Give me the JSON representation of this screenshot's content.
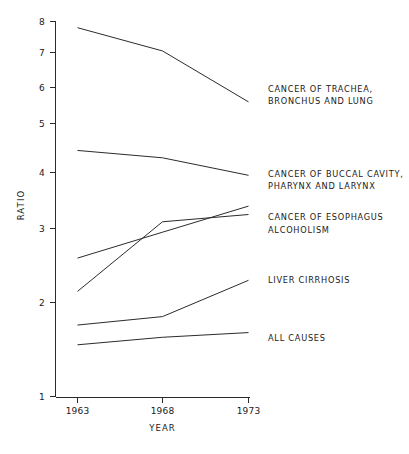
{
  "chart_data": {
    "type": "line",
    "title": "",
    "xlabel": "YEAR",
    "ylabel": "RATIO",
    "x": [
      1963,
      1968,
      1973
    ],
    "xtick_labels": [
      "1963",
      "1968",
      "1973"
    ],
    "ytick_labels": [
      "1",
      "2",
      "3",
      "4",
      "5",
      "6",
      "7",
      "8"
    ],
    "ytick_values": [
      1,
      2,
      3,
      4,
      5,
      6,
      7,
      8
    ],
    "ylim": [
      1,
      8
    ],
    "yscale": "log",
    "grid": false,
    "legend_position": "right-inline",
    "series": [
      {
        "name": "CANCER OF TRACHEA, BRONCHUS AND LUNG",
        "label_lines": [
          "CANCER OF TRACHEA,",
          "BRONCHUS AND LUNG"
        ],
        "values": [
          7.8,
          7.05,
          5.6
        ]
      },
      {
        "name": "CANCER OF BUCCAL CAVITY, PHARYNX AND LARYNX",
        "label_lines": [
          "CANCER OF BUCCAL CAVITY,",
          "PHARYNX AND LARYNX"
        ],
        "values": [
          4.45,
          4.3,
          3.95
        ]
      },
      {
        "name": "CANCER OF ESOPHAGUS",
        "label_lines": [
          "CANCER OF ESOPHAGUS"
        ],
        "values": [
          2.6,
          2.95,
          3.4
        ]
      },
      {
        "name": "ALCOHOLISM",
        "label_lines": [
          "ALCOHOLISM"
        ],
        "values": [
          2.15,
          3.12,
          3.25
        ]
      },
      {
        "name": "LIVER CIRRHOSIS",
        "label_lines": [
          "LIVER CIRRHOSIS"
        ],
        "values": [
          1.76,
          1.85,
          2.3
        ]
      },
      {
        "name": "ALL CAUSES",
        "label_lines": [
          "ALL CAUSES"
        ],
        "values": [
          1.55,
          1.63,
          1.68
        ]
      }
    ]
  },
  "axes": {
    "y_title": "RATIO",
    "x_title": "YEAR"
  },
  "labels": {
    "trachea_line1": "CANCER OF TRACHEA,",
    "trachea_line2": "BRONCHUS AND LUNG",
    "buccal_line1": "CANCER OF BUCCAL CAVITY,",
    "buccal_line2": "PHARYNX AND LARYNX",
    "esophagus": "CANCER OF ESOPHAGUS",
    "alcoholism": "ALCOHOLISM",
    "cirrhosis": "LIVER CIRRHOSIS",
    "all_causes": "ALL CAUSES"
  },
  "yticks": {
    "t1": "1",
    "t2": "2",
    "t3": "3",
    "t4": "4",
    "t5": "5",
    "t6": "6",
    "t7": "7",
    "t8": "8"
  },
  "xticks": {
    "x1": "1963",
    "x2": "1968",
    "x3": "1973"
  },
  "colors": {
    "line": "#2b2b2b",
    "text": "#1a1a1a",
    "background": "#ffffff"
  }
}
